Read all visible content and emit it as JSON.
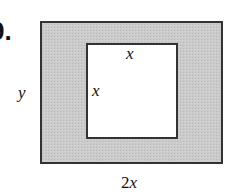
{
  "problem": {
    "number_label": "9."
  },
  "diagram": {
    "outer_rect": {
      "x": 41,
      "y": 22,
      "width": 181,
      "height": 141,
      "fill": "#c9c9c9",
      "stroke": "#333333"
    },
    "inner_rect": {
      "x": 87,
      "y": 44,
      "width": 90,
      "height": 94,
      "fill": "#ffffff",
      "stroke": "#333333"
    },
    "labels": {
      "outer_height": "y",
      "outer_width": "2x",
      "inner_top": "x",
      "inner_left": "x"
    }
  }
}
